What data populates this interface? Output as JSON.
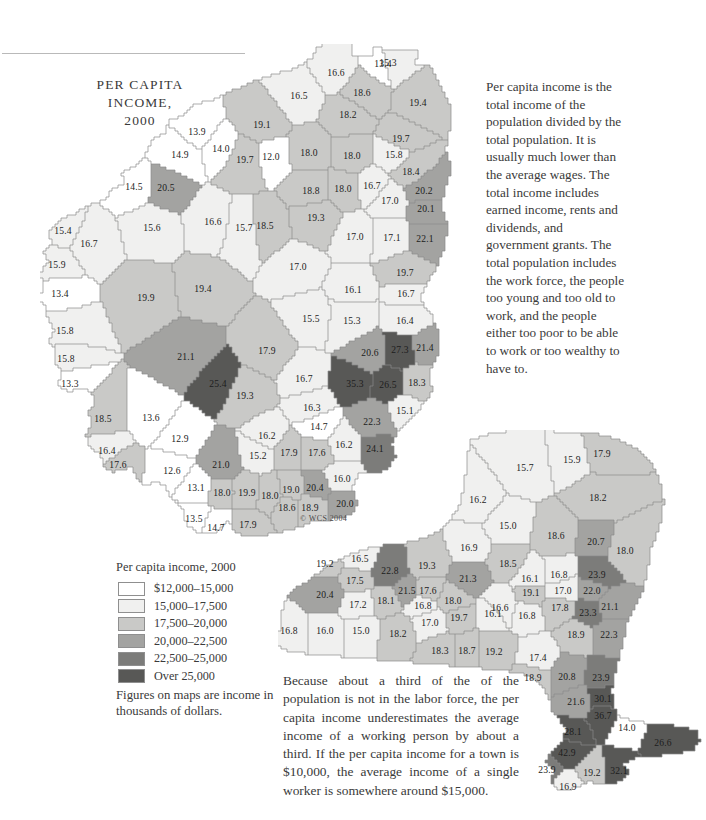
{
  "document": {
    "title_lines": [
      "PER CAPITA",
      "INCOME,",
      "2000"
    ],
    "copyright": "© WCS 2004"
  },
  "intro_text": "Per capita income is the total income of the population divided by the total population. It is usually much lower than the average wages. The total income includes earned income, rents and dividends, and government grants. The total population includes the work force, the people too young and too old to work, and the people either too poor to be able to work or too wealthy to have to.",
  "note_text": "Because about a third of the of the population is not in the labor force, the per capita income underestimates the average income of a working person by about a third. If the per capita income for a town is $10,000, the average income of a single worker is somewhere around $15,000.",
  "legend": {
    "title": "Per capita income, 2000",
    "classes": [
      {
        "label": "$12,000–15,000",
        "color": "#ffffff"
      },
      {
        "label": "15,000–17,500",
        "color": "#f0f0ef"
      },
      {
        "label": "17,500–20,000",
        "color": "#c9c9c7"
      },
      {
        "label": "20,000–22,500",
        "color": "#a3a3a1"
      },
      {
        "label": "22,500–25,000",
        "color": "#7c7c7a"
      },
      {
        "label": "Over 25,000",
        "color": "#585856"
      }
    ],
    "footnote": "Figures on maps are income in thousands of dollars."
  },
  "chart_data": {
    "type": "choropleth-map",
    "title": "PER CAPITA INCOME, 2000",
    "unit": "thousands of dollars",
    "legend_bins": [
      {
        "min": 12.0,
        "max": 15.0,
        "color": "#ffffff"
      },
      {
        "min": 15.0,
        "max": 17.5,
        "color": "#f0f0ef"
      },
      {
        "min": 17.5,
        "max": 20.0,
        "color": "#c9c9c7"
      },
      {
        "min": 20.0,
        "max": 22.5,
        "color": "#a3a3a1"
      },
      {
        "min": 22.5,
        "max": 25.0,
        "color": "#7c7c7a"
      },
      {
        "min": 25.0,
        "max": null,
        "color": "#585856"
      }
    ],
    "panels": [
      {
        "name": "main-region-map",
        "values": [
          {
            "v": "13.4",
            "x": 383,
            "y": 63
          },
          {
            "v": "15.3",
            "x": 388,
            "y": 62
          },
          {
            "v": "16.6",
            "x": 336,
            "y": 72
          },
          {
            "v": "18.6",
            "x": 362,
            "y": 92
          },
          {
            "v": "16.5",
            "x": 299,
            "y": 95
          },
          {
            "v": "19.4",
            "x": 418,
            "y": 102
          },
          {
            "v": "18.2",
            "x": 348,
            "y": 114
          },
          {
            "v": "13.9",
            "x": 197,
            "y": 131
          },
          {
            "v": "19.1",
            "x": 262,
            "y": 124
          },
          {
            "v": "19.7",
            "x": 401,
            "y": 138
          },
          {
            "v": "14.9",
            "x": 180,
            "y": 154
          },
          {
            "v": "14.0",
            "x": 221,
            "y": 148
          },
          {
            "v": "19.7",
            "x": 245,
            "y": 159
          },
          {
            "v": "12.0",
            "x": 271,
            "y": 156
          },
          {
            "v": "18.0",
            "x": 309,
            "y": 152
          },
          {
            "v": "18.0",
            "x": 352,
            "y": 155
          },
          {
            "v": "15.8",
            "x": 394,
            "y": 154
          },
          {
            "v": "18.4",
            "x": 411,
            "y": 171
          },
          {
            "v": "14.5",
            "x": 134,
            "y": 186
          },
          {
            "v": "20.5",
            "x": 166,
            "y": 187
          },
          {
            "v": "18.8",
            "x": 311,
            "y": 190
          },
          {
            "v": "18.0",
            "x": 343,
            "y": 188
          },
          {
            "v": "16.7",
            "x": 372,
            "y": 185
          },
          {
            "v": "20.2",
            "x": 424,
            "y": 190
          },
          {
            "v": "15.4",
            "x": 63,
            "y": 230
          },
          {
            "v": "16.7",
            "x": 89,
            "y": 243
          },
          {
            "v": "15.6",
            "x": 152,
            "y": 227
          },
          {
            "v": "16.6",
            "x": 213,
            "y": 221
          },
          {
            "v": "15.7",
            "x": 244,
            "y": 227
          },
          {
            "v": "18.5",
            "x": 265,
            "y": 225
          },
          {
            "v": "19.3",
            "x": 316,
            "y": 217
          },
          {
            "v": "17.0",
            "x": 390,
            "y": 200
          },
          {
            "v": "20.1",
            "x": 426,
            "y": 208
          },
          {
            "v": "17.0",
            "x": 355,
            "y": 236
          },
          {
            "v": "17.1",
            "x": 392,
            "y": 237
          },
          {
            "v": "22.1",
            "x": 425,
            "y": 238
          },
          {
            "v": "15.9",
            "x": 57,
            "y": 264
          },
          {
            "v": "13.4",
            "x": 60,
            "y": 293
          },
          {
            "v": "17.0",
            "x": 298,
            "y": 266
          },
          {
            "v": "19.7",
            "x": 405,
            "y": 272
          },
          {
            "v": "19.9",
            "x": 146,
            "y": 297
          },
          {
            "v": "19.4",
            "x": 203,
            "y": 288
          },
          {
            "v": "16.1",
            "x": 353,
            "y": 289
          },
          {
            "v": "16.7",
            "x": 406,
            "y": 293
          },
          {
            "v": "15.8",
            "x": 65,
            "y": 330
          },
          {
            "v": "15.8",
            "x": 66,
            "y": 358
          },
          {
            "v": "15.5",
            "x": 311,
            "y": 318
          },
          {
            "v": "15.3",
            "x": 352,
            "y": 320
          },
          {
            "v": "16.4",
            "x": 405,
            "y": 320
          },
          {
            "v": "13.3",
            "x": 70,
            "y": 383
          },
          {
            "v": "21.1",
            "x": 186,
            "y": 356
          },
          {
            "v": "17.9",
            "x": 267,
            "y": 350
          },
          {
            "v": "20.6",
            "x": 370,
            "y": 352
          },
          {
            "v": "27.3",
            "x": 400,
            "y": 349
          },
          {
            "v": "21.4",
            "x": 425,
            "y": 347
          },
          {
            "v": "18.5",
            "x": 103,
            "y": 418
          },
          {
            "v": "13.6",
            "x": 151,
            "y": 417
          },
          {
            "v": "19.3",
            "x": 245,
            "y": 395
          },
          {
            "v": "25.4",
            "x": 218,
            "y": 383
          },
          {
            "v": "16.7",
            "x": 304,
            "y": 378
          },
          {
            "v": "35.3",
            "x": 355,
            "y": 383
          },
          {
            "v": "26.5",
            "x": 388,
            "y": 384
          },
          {
            "v": "18.3",
            "x": 417,
            "y": 382
          },
          {
            "v": "16.4",
            "x": 107,
            "y": 450
          },
          {
            "v": "17.6",
            "x": 118,
            "y": 464
          },
          {
            "v": "12.9",
            "x": 180,
            "y": 438
          },
          {
            "v": "16.3",
            "x": 312,
            "y": 407
          },
          {
            "v": "14.7",
            "x": 319,
            "y": 426
          },
          {
            "v": "22.3",
            "x": 372,
            "y": 421
          },
          {
            "v": "15.1",
            "x": 405,
            "y": 410
          },
          {
            "v": "12.6",
            "x": 172,
            "y": 470
          },
          {
            "v": "16.2",
            "x": 267,
            "y": 435
          },
          {
            "v": "21.0",
            "x": 221,
            "y": 464
          },
          {
            "v": "15.2",
            "x": 258,
            "y": 455
          },
          {
            "v": "17.9",
            "x": 289,
            "y": 452
          },
          {
            "v": "17.6",
            "x": 317,
            "y": 452
          },
          {
            "v": "16.2",
            "x": 344,
            "y": 444
          },
          {
            "v": "24.1",
            "x": 375,
            "y": 448
          },
          {
            "v": "13.1",
            "x": 196,
            "y": 487
          },
          {
            "v": "18.0",
            "x": 222,
            "y": 492
          },
          {
            "v": "19.9",
            "x": 247,
            "y": 492
          },
          {
            "v": "18.0",
            "x": 270,
            "y": 495
          },
          {
            "v": "19.0",
            "x": 291,
            "y": 489
          },
          {
            "v": "20.4",
            "x": 315,
            "y": 487
          },
          {
            "v": "16.0",
            "x": 342,
            "y": 478
          },
          {
            "v": "18.6",
            "x": 287,
            "y": 507
          },
          {
            "v": "18.9",
            "x": 310,
            "y": 507
          },
          {
            "v": "20.0",
            "x": 345,
            "y": 503
          },
          {
            "v": "13.5",
            "x": 194,
            "y": 518
          },
          {
            "v": "14.7",
            "x": 216,
            "y": 527
          },
          {
            "v": "17.9",
            "x": 248,
            "y": 524
          }
        ]
      },
      {
        "name": "new-york-state-map",
        "values": [
          {
            "v": "15.7",
            "x": 525,
            "y": 467
          },
          {
            "v": "15.9",
            "x": 572,
            "y": 459
          },
          {
            "v": "17.9",
            "x": 602,
            "y": 453
          },
          {
            "v": "16.2",
            "x": 478,
            "y": 499
          },
          {
            "v": "18.2",
            "x": 598,
            "y": 497
          },
          {
            "v": "15.0",
            "x": 508,
            "y": 525
          },
          {
            "v": "18.6",
            "x": 556,
            "y": 535
          },
          {
            "v": "20.7",
            "x": 596,
            "y": 541
          },
          {
            "v": "18.0",
            "x": 625,
            "y": 550
          },
          {
            "v": "19.2",
            "x": 325,
            "y": 563
          },
          {
            "v": "16.5",
            "x": 360,
            "y": 558
          },
          {
            "v": "22.8",
            "x": 390,
            "y": 570
          },
          {
            "v": "19.3",
            "x": 427,
            "y": 565
          },
          {
            "v": "16.9",
            "x": 469,
            "y": 547
          },
          {
            "v": "18.5",
            "x": 508,
            "y": 563
          },
          {
            "v": "16.1",
            "x": 530,
            "y": 578
          },
          {
            "v": "16.8",
            "x": 559,
            "y": 574
          },
          {
            "v": "23.9",
            "x": 597,
            "y": 574
          },
          {
            "v": "17.5",
            "x": 355,
            "y": 580
          },
          {
            "v": "21.5",
            "x": 407,
            "y": 590
          },
          {
            "v": "21.3",
            "x": 468,
            "y": 578
          },
          {
            "v": "17.0",
            "x": 563,
            "y": 590
          },
          {
            "v": "22.0",
            "x": 592,
            "y": 590
          },
          {
            "v": "19.1",
            "x": 531,
            "y": 592
          },
          {
            "v": "20.4",
            "x": 325,
            "y": 594
          },
          {
            "v": "17.2",
            "x": 358,
            "y": 604
          },
          {
            "v": "18.1",
            "x": 386,
            "y": 600
          },
          {
            "v": "16.8",
            "x": 423,
            "y": 605
          },
          {
            "v": "18.0",
            "x": 453,
            "y": 600
          },
          {
            "v": "17.6",
            "x": 428,
            "y": 590
          },
          {
            "v": "16.6",
            "x": 500,
            "y": 607
          },
          {
            "v": "16.1",
            "x": 493,
            "y": 613
          },
          {
            "v": "17.8",
            "x": 560,
            "y": 607
          },
          {
            "v": "21.1",
            "x": 610,
            "y": 606
          },
          {
            "v": "23.3",
            "x": 588,
            "y": 612
          },
          {
            "v": "16.8",
            "x": 289,
            "y": 630
          },
          {
            "v": "16.0",
            "x": 325,
            "y": 630
          },
          {
            "v": "15.0",
            "x": 361,
            "y": 630
          },
          {
            "v": "18.2",
            "x": 398,
            "y": 633
          },
          {
            "v": "17.0",
            "x": 430,
            "y": 622
          },
          {
            "v": "19.7",
            "x": 459,
            "y": 617
          },
          {
            "v": "16.8",
            "x": 527,
            "y": 615
          },
          {
            "v": "18.9",
            "x": 576,
            "y": 634
          },
          {
            "v": "22.3",
            "x": 609,
            "y": 634
          },
          {
            "v": "18.3",
            "x": 440,
            "y": 650
          },
          {
            "v": "18.7",
            "x": 467,
            "y": 650
          },
          {
            "v": "19.2",
            "x": 494,
            "y": 651
          },
          {
            "v": "17.4",
            "x": 538,
            "y": 657
          },
          {
            "v": "18.9",
            "x": 533,
            "y": 677
          },
          {
            "v": "20.8",
            "x": 567,
            "y": 676
          },
          {
            "v": "23.9",
            "x": 601,
            "y": 677
          },
          {
            "v": "21.6",
            "x": 576,
            "y": 701
          },
          {
            "v": "30.1",
            "x": 603,
            "y": 698
          },
          {
            "v": "36.7",
            "x": 603,
            "y": 715
          },
          {
            "v": "28.1",
            "x": 573,
            "y": 731
          },
          {
            "v": "14.0",
            "x": 627,
            "y": 727
          },
          {
            "v": "26.6",
            "x": 663,
            "y": 742
          },
          {
            "v": "42.9",
            "x": 567,
            "y": 752
          },
          {
            "v": "23.9",
            "x": 547,
            "y": 769
          },
          {
            "v": "19.2",
            "x": 592,
            "y": 772
          },
          {
            "v": "32.1",
            "x": 619,
            "y": 770
          },
          {
            "v": "16.9",
            "x": 568,
            "y": 786
          }
        ]
      }
    ]
  }
}
